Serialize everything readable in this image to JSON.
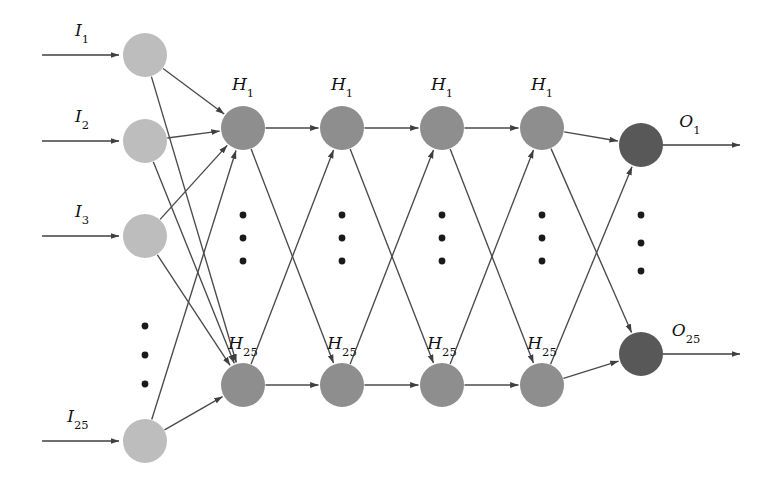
{
  "figure": {
    "kind": "neural-network-architecture-diagram",
    "background_color": "#ffffff"
  },
  "colors": {
    "input_node": "#bdbdbd",
    "hidden_node": "#8e8e8e",
    "output_node": "#585858",
    "edge": "#4a4a4a",
    "arrow": "#3f3f3f",
    "dot": "#1a1a1a",
    "label_text": "#111111"
  },
  "geometry": {
    "node_radius": 22,
    "output_node_radius": 22,
    "dot_radius": 3.4
  },
  "input_layer": {
    "name": "input-layer",
    "x": 145,
    "arrow_start_x": 42,
    "arrow_end_x": 119,
    "nodes": [
      {
        "id": "I1",
        "label": "I",
        "sub": "1",
        "y": 55,
        "label_x": 82,
        "label_y": 36
      },
      {
        "id": "I2",
        "label": "I",
        "sub": "2",
        "y": 141,
        "label_x": 82,
        "label_y": 122
      },
      {
        "id": "I3",
        "label": "I",
        "sub": "3",
        "y": 236,
        "label_x": 82,
        "label_y": 217
      },
      {
        "id": "I25",
        "label": "I",
        "sub": "25",
        "y": 441,
        "label_x": 78,
        "label_y": 422
      }
    ],
    "ellipsis": {
      "x": 145,
      "ys": [
        326,
        355,
        384
      ]
    }
  },
  "hidden_layers": {
    "name": "hidden-layers",
    "columns_x": [
      243,
      342,
      442,
      542
    ],
    "top_y": 128,
    "bottom_y": 385,
    "top_label": {
      "label": "H",
      "sub": "1"
    },
    "bottom_label": {
      "label": "H",
      "sub": "25"
    },
    "top_label_dy": -30,
    "bottom_label_dy": -28,
    "ellipsis_ys": [
      215,
      238,
      261
    ]
  },
  "output_layer": {
    "name": "output-layer",
    "x": 641,
    "arrow_start_x": 663,
    "arrow_end_x": 740,
    "nodes": [
      {
        "id": "O1",
        "label": "O",
        "sub": "1",
        "y": 145,
        "label_x": 690,
        "label_y": 127
      },
      {
        "id": "O25",
        "label": "O",
        "sub": "25",
        "y": 354,
        "label_x": 686,
        "label_y": 336
      }
    ],
    "ellipsis": {
      "x": 641,
      "ys": [
        215,
        243,
        271
      ]
    }
  },
  "connections": {
    "input_to_hidden": "every input node connects to both the top (H1) and bottom (H25) nodes of the first hidden column",
    "hidden_to_hidden": "each hidden column connects top-to-top, bottom-to-bottom, top-to-bottom and bottom-to-top with the next column",
    "hidden_to_output": "the last hidden column connects top and bottom nodes to both output nodes"
  }
}
